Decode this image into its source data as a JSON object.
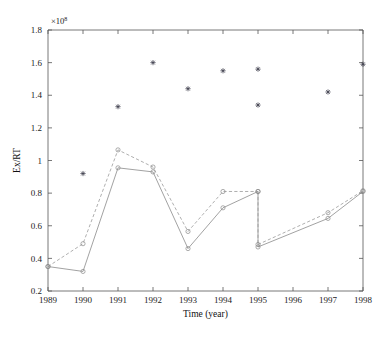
{
  "figure": {
    "title": "",
    "exponent_label": "×10",
    "exponent_power": "8"
  },
  "axes": {
    "xlabel": "Time (year)",
    "ylabel": "Ex/RT",
    "xticks": [
      "1989",
      "1990",
      "1991",
      "1992",
      "1993",
      "1994",
      "1995",
      "1996",
      "1997",
      "1998"
    ],
    "yticks": [
      "0.2",
      "0.4",
      "0.6",
      "0.8",
      "1",
      "1.2",
      "1.4",
      "1.6",
      "1.8"
    ]
  },
  "chart_data": {
    "type": "line",
    "title": "",
    "xlabel": "Time (year)",
    "ylabel": "Ex/RT",
    "y_exponent": 8,
    "y_exponent_text": "×10^8",
    "xlim": [
      1989,
      1998
    ],
    "ylim": [
      0.2,
      1.8
    ],
    "xticks": [
      1989,
      1990,
      1991,
      1992,
      1993,
      1994,
      1995,
      1996,
      1997,
      1998
    ],
    "yticks": [
      0.2,
      0.4,
      0.6,
      0.8,
      1.0,
      1.2,
      1.4,
      1.6,
      1.8
    ],
    "grid": false,
    "legend": "none",
    "series": [
      {
        "name": "star-scatter",
        "style": "scatter",
        "marker": "star",
        "color": "#3b3b4a",
        "points": [
          {
            "x": 1990,
            "y": 0.92
          },
          {
            "x": 1991,
            "y": 1.33
          },
          {
            "x": 1992,
            "y": 1.6
          },
          {
            "x": 1993,
            "y": 1.44
          },
          {
            "x": 1994,
            "y": 1.55
          },
          {
            "x": 1995,
            "y": 1.56
          },
          {
            "x": 1995,
            "y": 1.34
          },
          {
            "x": 1997,
            "y": 1.42
          },
          {
            "x": 1998,
            "y": 1.59
          }
        ]
      },
      {
        "name": "solid-line",
        "style": "solid",
        "marker": "circle-open",
        "color": "#8a8a8a",
        "segments": [
          [
            {
              "x": 1989,
              "y": 0.35
            },
            {
              "x": 1990,
              "y": 0.32
            },
            {
              "x": 1991,
              "y": 0.955
            },
            {
              "x": 1992,
              "y": 0.93
            },
            {
              "x": 1993,
              "y": 0.46
            },
            {
              "x": 1994,
              "y": 0.71
            },
            {
              "x": 1995,
              "y": 0.81
            }
          ],
          [
            {
              "x": 1995,
              "y": 0.47
            },
            {
              "x": 1997,
              "y": 0.645
            },
            {
              "x": 1998,
              "y": 0.81
            }
          ]
        ],
        "drop_line": {
          "x": 1995,
          "y_from": 0.81,
          "y_to": 0.47
        }
      },
      {
        "name": "dashed-line",
        "style": "dashed",
        "marker": "circle-open",
        "color": "#9a9a9a",
        "segments": [
          [
            {
              "x": 1989,
              "y": 0.35
            },
            {
              "x": 1990,
              "y": 0.49
            },
            {
              "x": 1991,
              "y": 1.065
            },
            {
              "x": 1992,
              "y": 0.96
            },
            {
              "x": 1993,
              "y": 0.565
            },
            {
              "x": 1994,
              "y": 0.81
            },
            {
              "x": 1995,
              "y": 0.81
            }
          ],
          [
            {
              "x": 1995,
              "y": 0.485
            },
            {
              "x": 1997,
              "y": 0.68
            },
            {
              "x": 1998,
              "y": 0.815
            }
          ]
        ],
        "drop_line": {
          "x": 1995,
          "y_from": 0.81,
          "y_to": 0.485
        }
      }
    ]
  },
  "geometry": {
    "plot_left": 48,
    "plot_right": 363,
    "plot_top": 30,
    "plot_bottom": 291
  }
}
